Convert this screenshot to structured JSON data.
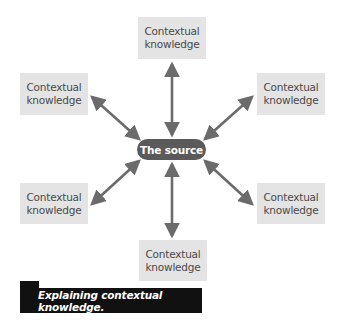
{
  "diagram": {
    "center": {
      "label": "The source"
    },
    "nodes": [
      {
        "id": "top",
        "line1": "Contextual",
        "line2": "knowledge"
      },
      {
        "id": "upper-left",
        "line1": "Contextual",
        "line2": "knowledge"
      },
      {
        "id": "upper-right",
        "line1": "Contextual",
        "line2": "knowledge"
      },
      {
        "id": "lower-left",
        "line1": "Contextual",
        "line2": "knowledge"
      },
      {
        "id": "lower-right",
        "line1": "Contextual",
        "line2": "knowledge"
      },
      {
        "id": "bottom",
        "line1": "Contextual",
        "line2": "knowledge"
      }
    ],
    "edges": "bidirectional arrows from The source to each Contextual knowledge box",
    "colors": {
      "box_fill": "#e4e4e4",
      "center_fill": "#5a5a5a",
      "arrow": "#6b6b6b",
      "caption_fill": "#111111"
    }
  },
  "caption": {
    "text": "Explaining contextual knowledge."
  }
}
